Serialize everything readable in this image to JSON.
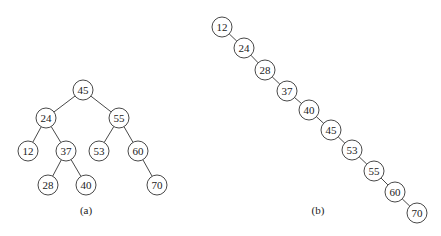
{
  "figure": {
    "panels": [
      {
        "id": "a",
        "caption": "(a)",
        "caption_pos": [
          86,
          214
        ],
        "description": "Balanced binary search tree",
        "nodes": [
          {
            "id": "45",
            "label": "45",
            "x": 83,
            "y": 90
          },
          {
            "id": "24",
            "label": "24",
            "x": 46,
            "y": 118
          },
          {
            "id": "55",
            "label": "55",
            "x": 119,
            "y": 118
          },
          {
            "id": "12",
            "label": "12",
            "x": 28,
            "y": 151
          },
          {
            "id": "37",
            "label": "37",
            "x": 66,
            "y": 151
          },
          {
            "id": "53",
            "label": "53",
            "x": 99,
            "y": 151
          },
          {
            "id": "60",
            "label": "60",
            "x": 138,
            "y": 151
          },
          {
            "id": "28",
            "label": "28",
            "x": 48,
            "y": 185
          },
          {
            "id": "40",
            "label": "40",
            "x": 86,
            "y": 185
          },
          {
            "id": "70",
            "label": "70",
            "x": 157,
            "y": 185
          }
        ],
        "edges": [
          [
            "45",
            "24"
          ],
          [
            "45",
            "55"
          ],
          [
            "24",
            "12"
          ],
          [
            "24",
            "37"
          ],
          [
            "55",
            "53"
          ],
          [
            "55",
            "60"
          ],
          [
            "37",
            "28"
          ],
          [
            "37",
            "40"
          ],
          [
            "60",
            "70"
          ]
        ]
      },
      {
        "id": "b",
        "caption": "(b)",
        "caption_pos": [
          318,
          214
        ],
        "description": "Degenerate (linked-list-like) binary search tree",
        "nodes": [
          {
            "id": "12",
            "label": "12",
            "x": 222,
            "y": 27
          },
          {
            "id": "24",
            "label": "24",
            "x": 244,
            "y": 48
          },
          {
            "id": "28",
            "label": "28",
            "x": 265,
            "y": 70
          },
          {
            "id": "37",
            "label": "37",
            "x": 287,
            "y": 91
          },
          {
            "id": "40",
            "label": "40",
            "x": 309,
            "y": 110
          },
          {
            "id": "45",
            "label": "45",
            "x": 331,
            "y": 130
          },
          {
            "id": "53",
            "label": "53",
            "x": 352,
            "y": 150
          },
          {
            "id": "55",
            "label": "55",
            "x": 374,
            "y": 171
          },
          {
            "id": "60",
            "label": "60",
            "x": 395,
            "y": 192
          },
          {
            "id": "70",
            "label": "70",
            "x": 417,
            "y": 213
          }
        ],
        "edges": [
          [
            "12",
            "24"
          ],
          [
            "24",
            "28"
          ],
          [
            "28",
            "37"
          ],
          [
            "37",
            "40"
          ],
          [
            "40",
            "45"
          ],
          [
            "45",
            "53"
          ],
          [
            "53",
            "55"
          ],
          [
            "55",
            "60"
          ],
          [
            "60",
            "70"
          ]
        ]
      }
    ],
    "style": {
      "node_radius": 10,
      "stroke_color": "#333333",
      "fill_color": "#ffffff",
      "text_color": "#222222"
    }
  }
}
